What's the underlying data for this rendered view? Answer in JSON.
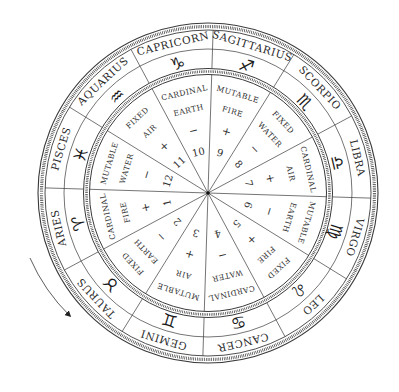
{
  "diagram": {
    "center": [
      208,
      193
    ],
    "rotation_offset_deg": 1.8,
    "direction_arrow": "counter-clockwise",
    "colors": {
      "line": "#3a3a3a",
      "text": "#2a2a2a",
      "background": "#ffffff"
    },
    "signs": [
      {
        "name": "ARIES",
        "glyph": "♈︎",
        "house": "1",
        "polarity": "+",
        "modality": "CARDINAL",
        "element": "FIRE"
      },
      {
        "name": "TAURUS",
        "glyph": "♉︎",
        "house": "2",
        "polarity": "−",
        "modality": "FIXED",
        "element": "EARTH"
      },
      {
        "name": "GEMINI",
        "glyph": "♊︎",
        "house": "3",
        "polarity": "+",
        "modality": "MUTABLE",
        "element": "AIR"
      },
      {
        "name": "CANCER",
        "glyph": "♋︎",
        "house": "4",
        "polarity": "−",
        "modality": "CARDINAL",
        "element": "WATER"
      },
      {
        "name": "LEO",
        "glyph": "♌︎",
        "house": "5",
        "polarity": "+",
        "modality": "FIXED",
        "element": "FIRE"
      },
      {
        "name": "VIRGO",
        "glyph": "♍︎",
        "house": "6",
        "polarity": "−",
        "modality": "MUTABLE",
        "element": "EARTH"
      },
      {
        "name": "LIBRA",
        "glyph": "♎︎",
        "house": "7",
        "polarity": "+",
        "modality": "CARDINAL",
        "element": "AIR"
      },
      {
        "name": "SCORPIO",
        "glyph": "♏︎",
        "house": "8",
        "polarity": "−",
        "modality": "FIXED",
        "element": "WATER"
      },
      {
        "name": "SAGITTARIUS",
        "glyph": "♐︎",
        "house": "9",
        "polarity": "+",
        "modality": "MUTABLE",
        "element": "FIRE"
      },
      {
        "name": "CAPRICORN",
        "glyph": "♑︎",
        "house": "10",
        "polarity": "−",
        "modality": "CARDINAL",
        "element": "EARTH"
      },
      {
        "name": "AQUARIUS",
        "glyph": "♒︎",
        "house": "11",
        "polarity": "+",
        "modality": "FIXED",
        "element": "AIR"
      },
      {
        "name": "PISCES",
        "glyph": "♓︎",
        "house": "12",
        "polarity": "−",
        "modality": "MUTABLE",
        "element": "WATER"
      }
    ]
  }
}
